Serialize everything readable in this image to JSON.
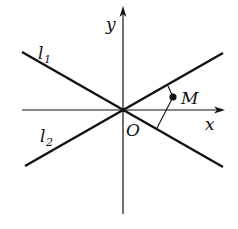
{
  "diagram": {
    "type": "coordinate-geometry",
    "labels": {
      "y_axis": "y",
      "x_axis": "x",
      "origin": "O",
      "line1": "l",
      "line1_sub": "1",
      "line2": "l",
      "line2_sub": "2",
      "point": "M"
    },
    "colors": {
      "stroke": "#111111",
      "background": "#ffffff"
    }
  }
}
